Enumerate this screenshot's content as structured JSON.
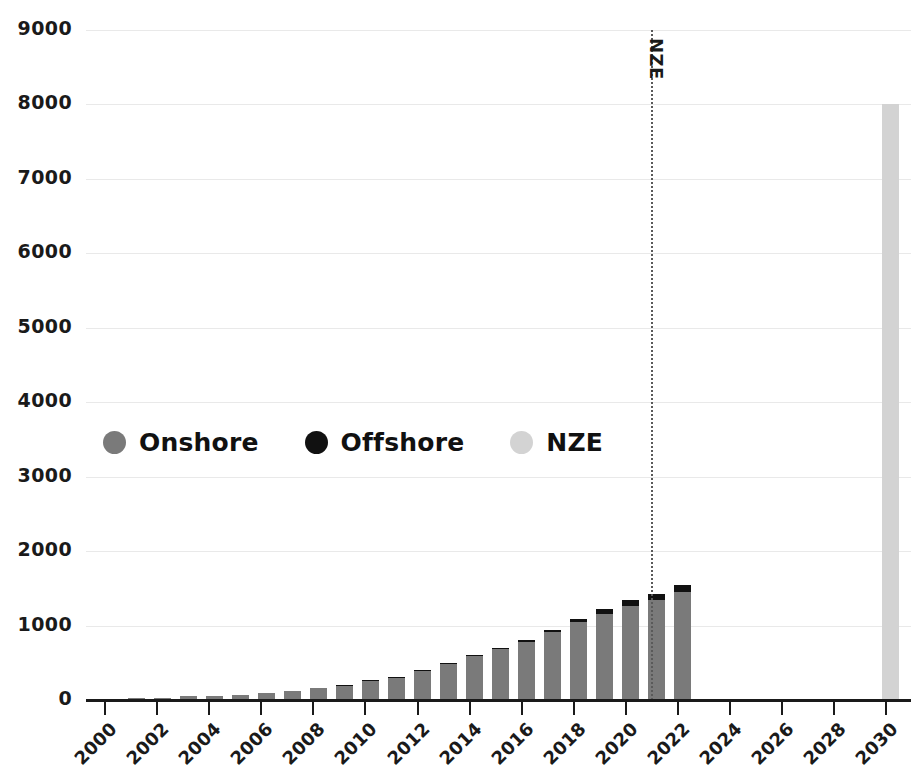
{
  "chart_data": {
    "type": "bar",
    "stacked": true,
    "title": "",
    "subtitle": "",
    "xlabel": "",
    "ylabel": "",
    "xlim": [
      1999.3,
      2031.0
    ],
    "ylim": [
      0,
      9000
    ],
    "y_ticks": [
      0,
      1000,
      2000,
      3000,
      4000,
      5000,
      6000,
      7000,
      8000,
      9000
    ],
    "y_tick_labels": [
      "0",
      "1000",
      "2000",
      "3000",
      "4000",
      "5000",
      "6000",
      "7000",
      "8000",
      "9000"
    ],
    "x_ticks": [
      2000,
      2002,
      2004,
      2006,
      2008,
      2010,
      2012,
      2014,
      2016,
      2018,
      2020,
      2022,
      2024,
      2026,
      2028,
      2030
    ],
    "x_tick_labels": [
      "2000",
      "2002",
      "2004",
      "2006",
      "2008",
      "2010",
      "2012",
      "2014",
      "2016",
      "2018",
      "2020",
      "2022",
      "2024",
      "2026",
      "2028",
      "2030"
    ],
    "grid": true,
    "grid_axis": "y",
    "legend_position": "center-left-inside",
    "categories": [
      2000,
      2001,
      2002,
      2003,
      2004,
      2005,
      2006,
      2007,
      2008,
      2009,
      2010,
      2011,
      2012,
      2013,
      2014,
      2015,
      2016,
      2017,
      2018,
      2019,
      2020,
      2030
    ],
    "series": [
      {
        "name": "Onshore",
        "color": "#7a7a7a",
        "values": [
          17,
          24,
          31,
          48,
          59,
          74,
          93,
          120,
          159,
          198,
          238,
          280,
          330,
          381,
          425,
          471,
          516,
          562,
          608,
          651,
          700,
          0
        ]
      },
      {
        "name": "Offshore",
        "color": "#111111",
        "values": [
          0,
          0,
          0,
          0,
          0,
          0,
          0,
          0,
          0,
          0,
          0,
          0,
          0,
          0,
          0,
          0,
          0,
          0,
          0,
          0,
          0,
          0
        ]
      },
      {
        "name": "NZE",
        "color": "#d3d3d3",
        "values": [
          0,
          0,
          0,
          0,
          0,
          0,
          0,
          0,
          0,
          0,
          0,
          0,
          0,
          0,
          0,
          0,
          0,
          0,
          0,
          0,
          0,
          0
        ]
      }
    ],
    "bars": [
      {
        "year": 2000,
        "onshore": 17,
        "offshore": 0,
        "nze": 0
      },
      {
        "year": 2001,
        "onshore": 24,
        "offshore": 0,
        "nze": 0
      },
      {
        "year": 2002,
        "onshore": 31,
        "offshore": 0,
        "nze": 0
      },
      {
        "year": 2003,
        "onshore": 48,
        "offshore": 0,
        "nze": 0
      },
      {
        "year": 2004,
        "onshore": 59,
        "offshore": 0,
        "nze": 0
      },
      {
        "year": 2005,
        "onshore": 74,
        "offshore": 0,
        "nze": 0
      },
      {
        "year": 2006,
        "onshore": 93,
        "offshore": 0,
        "nze": 0
      },
      {
        "year": 2007,
        "onshore": 120,
        "offshore": 0,
        "nze": 0
      },
      {
        "year": 2008,
        "onshore": 159,
        "offshore": 0,
        "nze": 0
      },
      {
        "year": 2009,
        "onshore": 198,
        "offshore": 2,
        "nze": 0
      },
      {
        "year": 2010,
        "onshore": 260,
        "offshore": 4,
        "nze": 0
      },
      {
        "year": 2011,
        "onshore": 310,
        "offshore": 5,
        "nze": 0
      },
      {
        "year": 2012,
        "onshore": 400,
        "offshore": 7,
        "nze": 0
      },
      {
        "year": 2013,
        "onshore": 490,
        "offshore": 10,
        "nze": 0
      },
      {
        "year": 2014,
        "onshore": 590,
        "offshore": 13,
        "nze": 0
      },
      {
        "year": 2015,
        "onshore": 685,
        "offshore": 20,
        "nze": 0
      },
      {
        "year": 2016,
        "onshore": 782,
        "offshore": 25,
        "nze": 0
      },
      {
        "year": 2017,
        "onshore": 910,
        "offshore": 35,
        "nze": 0
      },
      {
        "year": 2018,
        "onshore": 1050,
        "offshore": 45,
        "nze": 0
      },
      {
        "year": 2019,
        "onshore": 1160,
        "offshore": 62,
        "nze": 0
      },
      {
        "year": 2020,
        "onshore": 1260,
        "offshore": 78,
        "nze": 0
      },
      {
        "year": 2021,
        "onshore": 1340,
        "offshore": 90,
        "nze": 0
      },
      {
        "year": 2022,
        "onshore": 1450,
        "offshore": 100,
        "nze": 0
      },
      {
        "year": 2030,
        "onshore": 0,
        "offshore": 0,
        "nze": 8000
      }
    ],
    "annotations": [
      {
        "name": "nze-divider",
        "type": "vline",
        "x": 2021,
        "label": "NZE",
        "style": "dotted",
        "color": "#5a5a5a"
      }
    ],
    "legend": [
      {
        "label": "Onshore",
        "color": "#7a7a7a",
        "icon": "circle-swatch"
      },
      {
        "label": "Offshore",
        "color": "#111111",
        "icon": "circle-swatch"
      },
      {
        "label": "NZE",
        "color": "#d3d3d3",
        "icon": "circle-swatch"
      }
    ]
  }
}
